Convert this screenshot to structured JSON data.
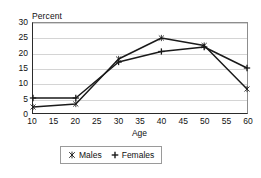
{
  "chart_data": {
    "type": "line",
    "title": "",
    "subtitle": "",
    "xlabel": "Age",
    "ylabel": "Percent",
    "ylabel_position": "above-axis",
    "x": [
      10,
      20,
      30,
      40,
      50,
      60
    ],
    "xlim": [
      10,
      60
    ],
    "ylim": [
      0,
      30
    ],
    "xticks": [
      10,
      15,
      20,
      25,
      30,
      35,
      40,
      45,
      50,
      55,
      60
    ],
    "yticks": [
      0,
      5,
      10,
      15,
      20,
      25,
      30
    ],
    "grid": "horizontal",
    "legend_position": "below-axis-center",
    "series": [
      {
        "name": "Males",
        "marker": "asterisk",
        "color": "#1a1a1a",
        "values": [
          2,
          3,
          18,
          25,
          22.5,
          8
        ]
      },
      {
        "name": "Females",
        "marker": "plus",
        "color": "#1a1a1a",
        "values": [
          5,
          5,
          17,
          20.5,
          22,
          15
        ]
      }
    ]
  },
  "axes": {
    "y_title": "Percent",
    "x_title": "Age",
    "y_tick_labels": [
      "0",
      "5",
      "10",
      "15",
      "20",
      "25",
      "30"
    ],
    "x_tick_labels": [
      "10",
      "15",
      "20",
      "25",
      "30",
      "35",
      "40",
      "45",
      "50",
      "55",
      "60"
    ]
  },
  "legend": {
    "items": [
      {
        "label": "Males",
        "marker": "asterisk-marker"
      },
      {
        "label": "Females",
        "marker": "plus-marker"
      }
    ]
  },
  "colors": {
    "series_line": "#1a1a1a",
    "grid": "#d4d4d4",
    "axis": "#2b2b2b",
    "frame": "#8d8d8d",
    "background": "#ffffff"
  }
}
